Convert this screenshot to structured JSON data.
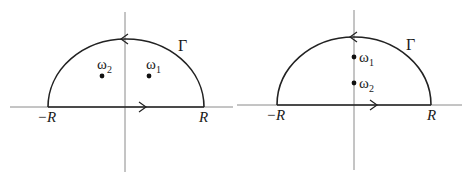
{
  "figure": {
    "colors": {
      "axis": "#8a8a8a",
      "contour": "#222222",
      "text": "#1a1a1a",
      "background": "#ffffff"
    },
    "panels": [
      {
        "id": "left",
        "contour_label": "Γ",
        "left_endpoint_label": "−R",
        "right_endpoint_label": "R",
        "points": [
          {
            "label": "ω",
            "subscript": "2",
            "position": "upper-left of imaginary axis"
          },
          {
            "label": "ω",
            "subscript": "1",
            "position": "upper-right of imaginary axis"
          }
        ]
      },
      {
        "id": "right",
        "contour_label": "Γ",
        "left_endpoint_label": "−R",
        "right_endpoint_label": "R",
        "points": [
          {
            "label": "ω",
            "subscript": "1",
            "position": "on imaginary axis, higher"
          },
          {
            "label": "ω",
            "subscript": "2",
            "position": "on imaginary axis, lower"
          }
        ]
      }
    ]
  }
}
